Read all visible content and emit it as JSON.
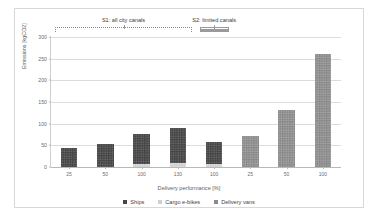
{
  "chart_data": {
    "type": "bar",
    "title": "",
    "xlabel": "Delivery performance [%]",
    "ylabel": "Emissions [kgCO2]",
    "ylim": [
      0,
      300
    ],
    "yticks": [
      0,
      50,
      100,
      150,
      200,
      250,
      300
    ],
    "grid": true,
    "legend_position": "bottom",
    "stacked": true,
    "categories": [
      "25",
      "50",
      "100",
      "130",
      "100",
      "25",
      "50",
      "100"
    ],
    "series": [
      {
        "name": "Ships",
        "color": "#464646",
        "values": [
          43,
          54,
          70,
          81,
          52,
          0,
          0,
          0
        ]
      },
      {
        "name": "Cargo e-bikes",
        "color": "#cfcfcf",
        "values": [
          0,
          0,
          7,
          9,
          6,
          0,
          0,
          0
        ]
      },
      {
        "name": "Delivery vans",
        "color": "#8a8a8a",
        "values": [
          0,
          0,
          0,
          0,
          0,
          72,
          131,
          260
        ]
      }
    ],
    "totals": [
      43,
      54,
      77,
      90,
      58,
      72,
      131,
      260
    ],
    "annotations": [
      {
        "label": "S1: all city canals",
        "spans_categories": [
          0,
          3
        ]
      },
      {
        "label": "S2: limited canals",
        "spans_categories": [
          4,
          4
        ]
      }
    ]
  },
  "legend": {
    "items": [
      {
        "label": "Ships"
      },
      {
        "label": "Cargo e-bikes"
      },
      {
        "label": "Delivery vans"
      }
    ]
  }
}
